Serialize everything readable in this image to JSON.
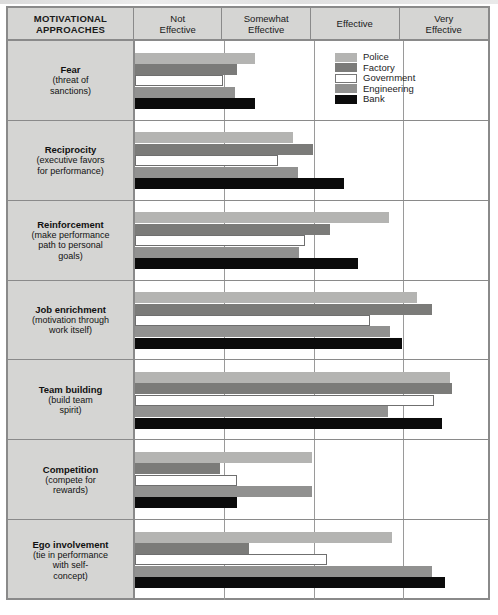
{
  "header": {
    "row_header": "MOTIVATIONAL\nAPPROACHES",
    "row_header_line1": "MOTIVATIONAL",
    "row_header_line2": "APPROACHES",
    "scale": [
      {
        "line1": "Not",
        "line2": "Effective"
      },
      {
        "line1": "Somewhat",
        "line2": "Effective"
      },
      {
        "line1": "Effective",
        "line2": ""
      },
      {
        "line1": "Very",
        "line2": "Effective"
      }
    ]
  },
  "legend": {
    "items": [
      {
        "label": "Police",
        "key": "police",
        "color": "#b4b4b2"
      },
      {
        "label": "Factory",
        "key": "factory",
        "color": "#7b7b79"
      },
      {
        "label": "Government",
        "key": "government",
        "color": "#ffffff"
      },
      {
        "label": "Engineering",
        "key": "engineering",
        "color": "#919190"
      },
      {
        "label": "Bank",
        "key": "bank",
        "color": "#0b0b0b"
      }
    ]
  },
  "rows": [
    {
      "name": "Fear",
      "sub_line1": "(threat of",
      "sub_line2": "sanctions)",
      "sub_line3": ""
    },
    {
      "name": "Reciprocity",
      "sub_line1": "(executive favors",
      "sub_line2": "for performance)",
      "sub_line3": ""
    },
    {
      "name": "Reinforcement",
      "sub_line1": "(make performance",
      "sub_line2": "path to personal",
      "sub_line3": "goals)"
    },
    {
      "name": "Job enrichment",
      "sub_line1": "(motivation through",
      "sub_line2": "work itself)",
      "sub_line3": ""
    },
    {
      "name": "Team building",
      "sub_line1": "(build team",
      "sub_line2": "spirit)",
      "sub_line3": ""
    },
    {
      "name": "Competition",
      "sub_line1": "(compete for",
      "sub_line2": "rewards)",
      "sub_line3": ""
    },
    {
      "name": "Ego involvement",
      "sub_line1": "(tie in performance",
      "sub_line2": "with self-",
      "sub_line3": "concept)"
    }
  ],
  "chart_data": {
    "type": "bar",
    "orientation": "horizontal",
    "title": "",
    "xlabel": "",
    "ylabel": "MOTIVATIONAL APPROACHES",
    "grid": true,
    "legend_position": "inside-top-right",
    "x_tick_labels": [
      "Not Effective",
      "Somewhat Effective",
      "Effective",
      "Very Effective"
    ],
    "xlim": [
      0,
      4
    ],
    "categories": [
      "Fear (threat of sanctions)",
      "Reciprocity (executive favors for performance)",
      "Reinforcement (make performance path to personal goals)",
      "Job enrichment (motivation through work itself)",
      "Team building (build team spirit)",
      "Competition (compete for rewards)",
      "Ego involvement (tie in performance with self-concept)"
    ],
    "series": [
      {
        "name": "Police",
        "color": "#b4b4b2",
        "values": [
          1.35,
          1.77,
          2.85,
          3.16,
          3.53,
          1.98,
          2.88
        ]
      },
      {
        "name": "Factory",
        "color": "#7b7b79",
        "values": [
          1.14,
          1.99,
          2.18,
          3.33,
          3.55,
          0.95,
          1.28
        ]
      },
      {
        "name": "Government",
        "color": "#ffffff",
        "values": [
          0.99,
          1.6,
          1.91,
          2.63,
          3.35,
          1.14,
          2.15
        ]
      },
      {
        "name": "Engineering",
        "color": "#919190",
        "values": [
          1.12,
          1.83,
          1.84,
          2.86,
          2.83,
          1.98,
          3.33
        ]
      },
      {
        "name": "Bank",
        "color": "#0b0b0b",
        "values": [
          1.35,
          2.34,
          2.5,
          2.99,
          3.44,
          1.14,
          3.47
        ]
      }
    ]
  }
}
